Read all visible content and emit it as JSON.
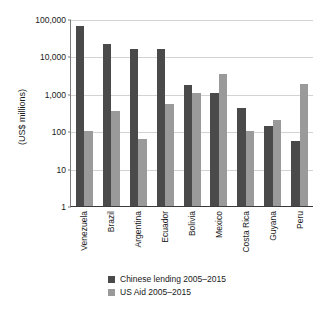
{
  "chart_data": {
    "type": "bar",
    "title": "",
    "subtitle": "",
    "xlabel": "",
    "ylabel": "(US$ millions)",
    "yscale": "log",
    "ylim": [
      1,
      100000
    ],
    "ytick_labels": [
      "100,000",
      "10,000",
      "1,000",
      "100",
      "10",
      "1"
    ],
    "ytick_values": [
      100000,
      10000,
      1000,
      100,
      10,
      1
    ],
    "grid": true,
    "legend_position": "bottom",
    "categories": [
      "Venezuela",
      "Brazil",
      "Argentina",
      "Ecuador",
      "Bolivia",
      "Mexico",
      "Costa Rica",
      "Guyana",
      "Peru"
    ],
    "series": [
      {
        "name": "Chinese lending 2005–2015",
        "color": "#4a4a4a",
        "values": [
          65000,
          22000,
          16000,
          16000,
          1700,
          1080,
          420,
          140,
          55
        ]
      },
      {
        "name": "US Aid  2005–2015",
        "color": "#9a9a9a",
        "values": [
          100,
          350,
          62,
          550,
          1050,
          3400,
          100,
          205,
          1850
        ]
      }
    ]
  },
  "colors": {
    "chinese_lending": "#4a4a4a",
    "us_aid": "#9a9a9a",
    "gridline": "#d3d3d3",
    "axis": "#3a3a3a",
    "background": "#ffffff"
  }
}
